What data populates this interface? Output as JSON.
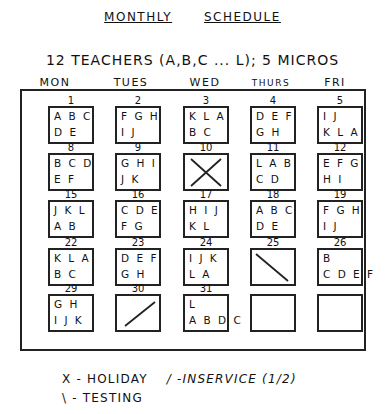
{
  "header": {
    "title_word1": "MONTHLY",
    "title_word2": "SCHEDULE",
    "subtitle": "12 TEACHERS (A,B,C ... L); 5 MICROS"
  },
  "days": [
    "MON",
    "TUES",
    "WED",
    "THURS",
    "FRI"
  ],
  "weeks": [
    [
      {
        "day": "1",
        "line1": "A B C",
        "line2": "D E",
        "mark": ""
      },
      {
        "day": "2",
        "line1": "F G H",
        "line2": "I J",
        "mark": ""
      },
      {
        "day": "3",
        "line1": "K L A",
        "line2": "B C",
        "mark": ""
      },
      {
        "day": "4",
        "line1": "D E F",
        "line2": "G H",
        "mark": ""
      },
      {
        "day": "5",
        "line1": "I J",
        "line2": "K L A",
        "mark": ""
      }
    ],
    [
      {
        "day": "8",
        "line1": "B C D",
        "line2": "E F",
        "mark": ""
      },
      {
        "day": "9",
        "line1": "G H I",
        "line2": "J K",
        "mark": ""
      },
      {
        "day": "10",
        "line1": "",
        "line2": "",
        "mark": "holiday"
      },
      {
        "day": "11",
        "line1": "L A B",
        "line2": "C D",
        "mark": ""
      },
      {
        "day": "12",
        "line1": "E F G",
        "line2": "H I",
        "mark": ""
      }
    ],
    [
      {
        "day": "15",
        "line1": "J K L",
        "line2": "A B",
        "mark": ""
      },
      {
        "day": "16",
        "line1": "C D E",
        "line2": "F G",
        "mark": ""
      },
      {
        "day": "17",
        "line1": "H I J",
        "line2": "K L",
        "mark": ""
      },
      {
        "day": "18",
        "line1": "A B C",
        "line2": "D E",
        "mark": ""
      },
      {
        "day": "19",
        "line1": "F G H",
        "line2": "I J",
        "mark": ""
      }
    ],
    [
      {
        "day": "22",
        "line1": "K L A",
        "line2": "B C",
        "mark": ""
      },
      {
        "day": "23",
        "line1": "D E F",
        "line2": "G H",
        "mark": ""
      },
      {
        "day": "24",
        "line1": "I J K",
        "line2": "L A",
        "mark": ""
      },
      {
        "day": "25",
        "line1": "",
        "line2": "",
        "mark": "testing"
      },
      {
        "day": "26",
        "line1": "B",
        "line2": "C D E F",
        "mark": ""
      }
    ],
    [
      {
        "day": "29",
        "line1": "G H",
        "line2": "I J K",
        "mark": ""
      },
      {
        "day": "30",
        "line1": "",
        "line2": "",
        "mark": "inservice"
      },
      {
        "day": "31",
        "line1": "L",
        "line2": "A B D C",
        "mark": ""
      },
      {
        "day": "",
        "line1": "",
        "line2": "",
        "mark": ""
      },
      {
        "day": "",
        "line1": "",
        "line2": "",
        "mark": ""
      }
    ]
  ],
  "legend": {
    "holiday": "X - HOLIDAY",
    "inservice": "/ -INSERVICE (1/2)",
    "testing": "\\ - TESTING"
  }
}
